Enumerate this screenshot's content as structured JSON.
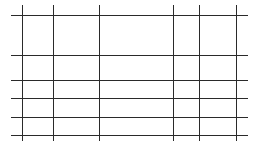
{
  "grid": {
    "line_color": "#2a2a2a",
    "background": "#ffffff",
    "horizontal_lines": {
      "x_start": 11,
      "x_end": 248,
      "y_positions": [
        15,
        55,
        80,
        98,
        117,
        135
      ]
    },
    "vertical_lines": {
      "y_start": 5,
      "y_end": 141,
      "x_positions": [
        22,
        53,
        99,
        173,
        199,
        236
      ]
    },
    "rows": 5,
    "columns": 5
  }
}
